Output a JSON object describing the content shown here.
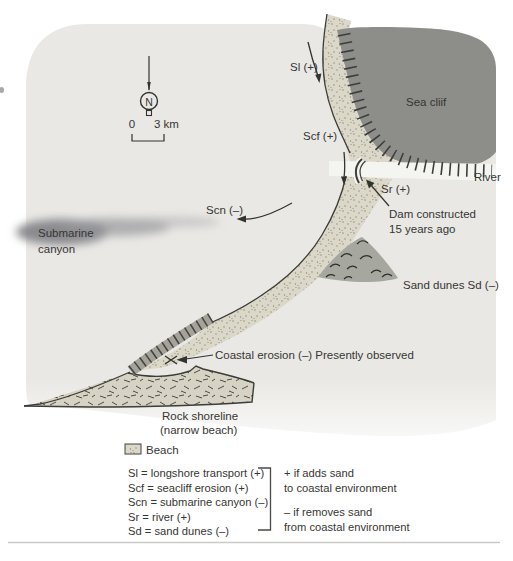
{
  "compass": {
    "north_label": "N"
  },
  "scale_bar": {
    "zero_label": "0",
    "distance_label": "3 km"
  },
  "map": {
    "labels": {
      "longshore": "Sl (+)",
      "seacliff_erosion": "Scf (+)",
      "river_input": "Sr (+)",
      "submarine_canyon_flux": "Scn (–)",
      "sea_cliff": "Sea cliif",
      "river": "River",
      "dam_line1": "Dam constructed",
      "dam_line2": "15 years ago",
      "submarine_canyon_line1": "Submarine",
      "submarine_canyon_line2": "canyon",
      "sand_dunes": "Sand dunes Sd (–)",
      "coastal_erosion": "Coastal erosion (–) Presently observed",
      "rock_shoreline_line1": "Rock shoreline",
      "rock_shoreline_line2": "(narrow beach)"
    }
  },
  "legend": {
    "beach_label": "Beach",
    "items": [
      "Sl = longshore transport (+)",
      "Scf = seacliff erosion (+)",
      "Scn = submarine canyon (–)",
      "Sr = river (+)",
      "Sd = sand dunes (–)"
    ],
    "plus_note_line1": "+ if adds sand",
    "plus_note_line2": "to coastal environment",
    "minus_note_line1": "– if removes sand",
    "minus_note_line2": "from coastal environment"
  },
  "colors": {
    "ocean": "#e9e8e5",
    "sea_cliff": "#8d8d8a",
    "beach": "#dcd8c9",
    "sand_dunes": "#a6a79f",
    "rock_shoreline": "#d6d3c5",
    "river": "#f4f4f1",
    "ink": "#363633"
  }
}
